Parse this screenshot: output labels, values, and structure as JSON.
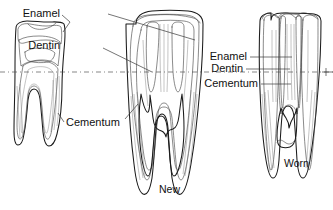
{
  "figure": {
    "background_color": "#ffffff",
    "ink_color": "#1b1b1b",
    "width": 333,
    "height": 210
  },
  "gumline": {
    "name": "gum-line",
    "style": "dash-dot",
    "y": 72
  },
  "labels": {
    "left_group": {
      "enamel": "Enamel",
      "dentin": "Dentin",
      "cementum": "Cementum"
    },
    "right_group": {
      "enamel": "Enamel",
      "dentin": "Dentin",
      "cementum": "Cementum"
    }
  },
  "specimens": [
    {
      "id": "left-tooth",
      "caption": "",
      "description": "Small two-rooted tooth cross-section, crown worn low"
    },
    {
      "id": "center-tooth",
      "caption": "New",
      "description": "Tall unworn two-rooted tooth with high crown"
    },
    {
      "id": "right-tooth",
      "caption": "Worn",
      "description": "Tall tooth with worn flat crown and exposed infundibula"
    }
  ],
  "tissue_fills": {
    "enamel": "#f4f4f4",
    "dentin": "#d8d8d8",
    "cementum": "#e6e6e6",
    "pulp": "#ffffff"
  }
}
